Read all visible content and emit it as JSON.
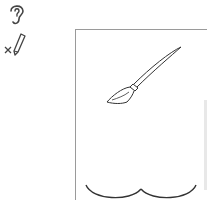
{
  "toolbar": {
    "tools": [
      {
        "name": "ear-icon",
        "label": ""
      },
      {
        "name": "close-small-icon",
        "label": ""
      },
      {
        "name": "pencil-icon",
        "label": ""
      }
    ]
  },
  "canvas": {
    "page": {
      "border_color": "#9a9a9a"
    },
    "drawing": {
      "items": [
        "paintbrush",
        "double-arc"
      ],
      "stroke_color": "#333333"
    }
  }
}
